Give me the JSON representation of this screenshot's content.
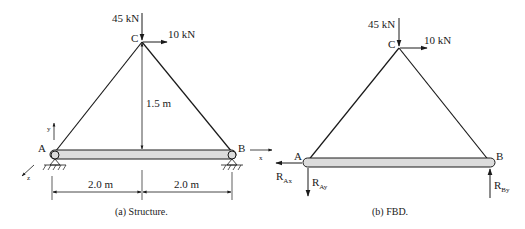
{
  "figure_a": {
    "caption": "(a)  Structure.",
    "load_vertical": "45 kN",
    "load_horizontal": "10 kN",
    "node_c": "C",
    "node_a": "A",
    "node_b": "B",
    "height_dim": "1.5 m",
    "span_left": "2.0 m",
    "span_right": "2.0 m",
    "axis_x": "x",
    "axis_y": "y",
    "axis_z": "z"
  },
  "figure_b": {
    "caption": "(b)  FBD.",
    "load_vertical": "45 kN",
    "load_horizontal": "10 kN",
    "node_c": "C",
    "node_a": "A",
    "node_b": "B",
    "reaction_ax": "R",
    "reaction_ax_sub": "Ax",
    "reaction_ay": "R",
    "reaction_ay_sub": "Ay",
    "reaction_by": "R",
    "reaction_by_sub": "By"
  },
  "colors": {
    "line": "#1a1a1a",
    "beam_fill": "#dcdcdc"
  }
}
